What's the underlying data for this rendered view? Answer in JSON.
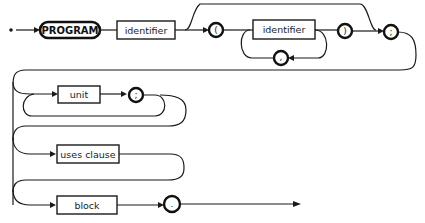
{
  "diagram": {
    "type": "syntax-diagram",
    "subject": "PROGRAM",
    "nodes": {
      "keyword": "PROGRAM",
      "identifier1": "identifier",
      "lparen": "(",
      "identifier2": "identifier",
      "rparen": ")",
      "comma": ",",
      "semicolon1": ";",
      "unit": "unit",
      "semicolon2": ";",
      "uses_clause": "uses clause",
      "block": "block",
      "period": "."
    },
    "colors": {
      "stroke": "#1a1a1a",
      "background": "#ffffff"
    }
  }
}
